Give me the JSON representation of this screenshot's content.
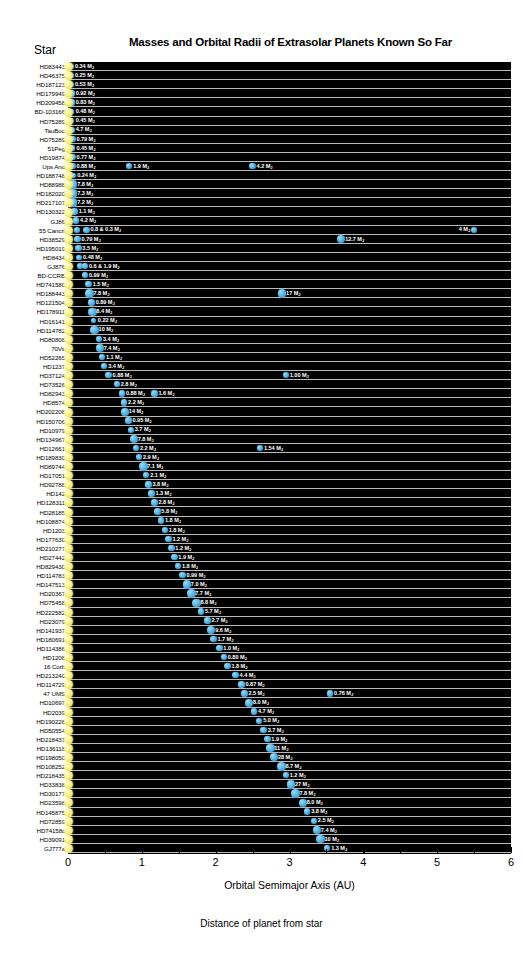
{
  "title": "Masses and Orbital Radii of Extrasolar Planets Known So Far",
  "star_column_header": "Star",
  "xlabel": "Orbital Semimajor Axis (AU)",
  "caption": "Distance of planet from star",
  "colors": {
    "plot_background": "#000000",
    "gridline": "#b9b9b9",
    "planet": "#5ab4e0",
    "star": "#f5f08a",
    "label_text": "#ffffff",
    "page_background": "#ffffff"
  },
  "axis": {
    "ticks": [
      "0",
      "1",
      "2",
      "3",
      "4",
      "5",
      "6"
    ],
    "min": 0,
    "max": 6,
    "minor_ticks_per_unit": 2
  },
  "mass_unit": "M",
  "mass_unit_sub": "J",
  "chart_data": {
    "type": "scatter",
    "title": "Masses and Orbital Radii of Extrasolar Planets Known So Far",
    "xlabel": "Orbital Semimajor Axis (AU)",
    "ylabel": "Star",
    "xlim": [
      0,
      6
    ],
    "grid": true,
    "legend": "none",
    "rows": [
      {
        "star": "HD83443",
        "planets": [
          {
            "a": 0.04,
            "label": "0.34 M"
          }
        ]
      },
      {
        "star": "HD46375",
        "planets": [
          {
            "a": 0.04,
            "label": "0.25 M"
          }
        ]
      },
      {
        "star": "HD187123",
        "planets": [
          {
            "a": 0.04,
            "label": "0.53 M"
          }
        ]
      },
      {
        "star": "HD179949",
        "planets": [
          {
            "a": 0.05,
            "label": "0.92 M"
          }
        ]
      },
      {
        "star": "HD209458",
        "planets": [
          {
            "a": 0.05,
            "label": "0.83 M"
          }
        ]
      },
      {
        "star": "BD-103166",
        "planets": [
          {
            "a": 0.05,
            "label": "0.48 M"
          }
        ]
      },
      {
        "star": "HD75289",
        "planets": [
          {
            "a": 0.05,
            "label": "0.45 M"
          }
        ]
      },
      {
        "star": "TauBoo",
        "planets": [
          {
            "a": 0.05,
            "label": "4.7 M"
          }
        ]
      },
      {
        "star": "HD75289",
        "planets": [
          {
            "a": 0.06,
            "label": "0.79 M"
          }
        ]
      },
      {
        "star": "51Peg",
        "planets": [
          {
            "a": 0.06,
            "label": "0.45 M"
          }
        ]
      },
      {
        "star": "HD19874",
        "planets": [
          {
            "a": 0.06,
            "label": "0.77 M"
          }
        ]
      },
      {
        "star": "Ups And",
        "planets": [
          {
            "a": 0.06,
            "label": "0.88 M"
          },
          {
            "a": 0.83,
            "label": "1.9 M"
          },
          {
            "a": 2.5,
            "label": "4.2 M"
          }
        ]
      },
      {
        "star": "HD188748",
        "planets": [
          {
            "a": 0.07,
            "label": "0.24 M"
          }
        ]
      },
      {
        "star": "HD88988",
        "planets": [
          {
            "a": 0.07,
            "label": "7.8 M"
          }
        ]
      },
      {
        "star": "HD182020",
        "planets": [
          {
            "a": 0.07,
            "label": "7.3 M"
          }
        ]
      },
      {
        "star": "HD217107",
        "planets": [
          {
            "a": 0.07,
            "label": "7.2 M"
          }
        ]
      },
      {
        "star": "HD130322",
        "planets": [
          {
            "a": 0.09,
            "label": "1.1 M"
          }
        ]
      },
      {
        "star": "GJ86",
        "planets": [
          {
            "a": 0.11,
            "label": "4.2 M"
          }
        ]
      },
      {
        "star": "55 Cancrf",
        "planets": [
          {
            "a": 0.12,
            "label": ""
          },
          {
            "a": 0.25,
            "label": "0.8 & 0.3 M"
          },
          {
            "a": 5.5,
            "label": "4 M",
            "flip": true
          }
        ]
      },
      {
        "star": "HD38529",
        "planets": [
          {
            "a": 0.13,
            "label": "0.79 M"
          },
          {
            "a": 3.7,
            "label": "12.7 M"
          }
        ]
      },
      {
        "star": "HD195019",
        "planets": [
          {
            "a": 0.14,
            "label": "3.5 M"
          }
        ]
      },
      {
        "star": "HD8434",
        "planets": [
          {
            "a": 0.15,
            "label": "0.48 M"
          }
        ]
      },
      {
        "star": "GJ876",
        "planets": [
          {
            "a": 0.16,
            "label": ""
          },
          {
            "a": 0.23,
            "label": "0.6 & 1.9 M"
          }
        ]
      },
      {
        "star": "BD-CCRB",
        "planets": [
          {
            "a": 0.23,
            "label": "0.99 M"
          }
        ]
      },
      {
        "star": "HD741580",
        "planets": [
          {
            "a": 0.28,
            "label": "1.5 M"
          }
        ]
      },
      {
        "star": "HD188443",
        "planets": [
          {
            "a": 0.29,
            "label": "7.8 M"
          },
          {
            "a": 2.9,
            "label": "17 M"
          }
        ]
      },
      {
        "star": "HD121504",
        "planets": [
          {
            "a": 0.32,
            "label": "0.89 M"
          }
        ]
      },
      {
        "star": "HD178911",
        "planets": [
          {
            "a": 0.33,
            "label": "8.4 M"
          }
        ]
      },
      {
        "star": "HD16141",
        "planets": [
          {
            "a": 0.35,
            "label": "0.22 M"
          }
        ]
      },
      {
        "star": "HD114782",
        "planets": [
          {
            "a": 0.36,
            "label": "10 M"
          }
        ]
      },
      {
        "star": "HD80808",
        "planets": [
          {
            "a": 0.42,
            "label": "3.4 M"
          }
        ]
      },
      {
        "star": "70Vir",
        "planets": [
          {
            "a": 0.43,
            "label": "7.4 M"
          }
        ]
      },
      {
        "star": "HD52265",
        "planets": [
          {
            "a": 0.46,
            "label": "1.1 M"
          }
        ]
      },
      {
        "star": "HD1237",
        "planets": [
          {
            "a": 0.49,
            "label": "3.4 M"
          }
        ]
      },
      {
        "star": "HD37124",
        "planets": [
          {
            "a": 0.55,
            "label": "0.88 M"
          },
          {
            "a": 2.95,
            "label": "1.00 M"
          }
        ]
      },
      {
        "star": "HD73526",
        "planets": [
          {
            "a": 0.66,
            "label": "2.8 M"
          }
        ]
      },
      {
        "star": "HD82943",
        "planets": [
          {
            "a": 0.73,
            "label": "0.88 M"
          },
          {
            "a": 1.17,
            "label": "1.6 M"
          }
        ]
      },
      {
        "star": "HD8574",
        "planets": [
          {
            "a": 0.76,
            "label": "2.2 M"
          }
        ]
      },
      {
        "star": "HD202206",
        "planets": [
          {
            "a": 0.77,
            "label": "14 M"
          }
        ]
      },
      {
        "star": "HD150706",
        "planets": [
          {
            "a": 0.82,
            "label": "0.95 M"
          }
        ]
      },
      {
        "star": "HD10979",
        "planets": [
          {
            "a": 0.85,
            "label": "3.7 M"
          }
        ]
      },
      {
        "star": "HD134967",
        "planets": [
          {
            "a": 0.89,
            "label": "7.8 M"
          }
        ]
      },
      {
        "star": "HD12661",
        "planets": [
          {
            "a": 0.92,
            "label": "2.2 M"
          },
          {
            "a": 2.6,
            "label": "1.54 M"
          }
        ]
      },
      {
        "star": "HD189830",
        "planets": [
          {
            "a": 0.96,
            "label": "2.9 M"
          }
        ]
      },
      {
        "star": "HD89744",
        "planets": [
          {
            "a": 1.02,
            "label": "7.1 M"
          }
        ]
      },
      {
        "star": "HD17051",
        "planets": [
          {
            "a": 1.06,
            "label": "2.1 M"
          }
        ]
      },
      {
        "star": "HD92788",
        "planets": [
          {
            "a": 1.09,
            "label": "3.8 M"
          }
        ]
      },
      {
        "star": "HD142",
        "planets": [
          {
            "a": 1.13,
            "label": "1.3 M"
          }
        ]
      },
      {
        "star": "HD128311",
        "planets": [
          {
            "a": 1.17,
            "label": "2.8 M"
          }
        ]
      },
      {
        "star": "HD28185",
        "planets": [
          {
            "a": 1.21,
            "label": "5.8 M"
          }
        ]
      },
      {
        "star": "HD108874",
        "planets": [
          {
            "a": 1.26,
            "label": "1.8 M"
          }
        ]
      },
      {
        "star": "HD1203",
        "planets": [
          {
            "a": 1.31,
            "label": "1.8 M"
          }
        ]
      },
      {
        "star": "HD177630",
        "planets": [
          {
            "a": 1.36,
            "label": "1.2 M"
          }
        ]
      },
      {
        "star": "HD210277",
        "planets": [
          {
            "a": 1.4,
            "label": "1.2 M"
          }
        ]
      },
      {
        "star": "HD27442",
        "planets": [
          {
            "a": 1.44,
            "label": "1.9 M"
          }
        ]
      },
      {
        "star": "HD829430",
        "planets": [
          {
            "a": 1.49,
            "label": "1.8 M"
          }
        ]
      },
      {
        "star": "HD114783",
        "planets": [
          {
            "a": 1.55,
            "label": "0.99 M"
          }
        ]
      },
      {
        "star": "HD147513",
        "planets": [
          {
            "a": 1.61,
            "label": "7.0 M"
          }
        ]
      },
      {
        "star": "HD20367",
        "planets": [
          {
            "a": 1.67,
            "label": "7.7 M"
          }
        ]
      },
      {
        "star": "HD75458",
        "planets": [
          {
            "a": 1.74,
            "label": "8.8 M"
          }
        ]
      },
      {
        "star": "HD222582",
        "planets": [
          {
            "a": 1.8,
            "label": "5.7 M"
          }
        ]
      },
      {
        "star": "HD23079",
        "planets": [
          {
            "a": 1.89,
            "label": "2.7 M"
          }
        ]
      },
      {
        "star": "HD141937",
        "planets": [
          {
            "a": 1.94,
            "label": "9.6 M"
          }
        ]
      },
      {
        "star": "HD180691",
        "planets": [
          {
            "a": 1.97,
            "label": "1.7 M"
          }
        ]
      },
      {
        "star": "HD114386",
        "planets": [
          {
            "a": 2.05,
            "label": "1.0 M"
          }
        ]
      },
      {
        "star": "HD1208",
        "planets": [
          {
            "a": 2.11,
            "label": "0.80 M"
          }
        ]
      },
      {
        "star": "16 Corb",
        "planets": [
          {
            "a": 2.16,
            "label": "1.8 M"
          }
        ]
      },
      {
        "star": "HD213240",
        "planets": [
          {
            "a": 2.27,
            "label": "4.4 M"
          }
        ]
      },
      {
        "star": "HD114729",
        "planets": [
          {
            "a": 2.35,
            "label": "0.87 M"
          }
        ]
      },
      {
        "star": "47 UMS",
        "planets": [
          {
            "a": 2.39,
            "label": "2.5 M"
          },
          {
            "a": 3.55,
            "label": "0.76 M"
          }
        ]
      },
      {
        "star": "HD10697",
        "planets": [
          {
            "a": 2.45,
            "label": "8.0 M"
          }
        ]
      },
      {
        "star": "HD2039",
        "planets": [
          {
            "a": 2.52,
            "label": "4.7 M"
          }
        ]
      },
      {
        "star": "HD190226",
        "planets": [
          {
            "a": 2.59,
            "label": "5.0 M"
          }
        ]
      },
      {
        "star": "HD50554",
        "planets": [
          {
            "a": 2.65,
            "label": "3.7 M"
          }
        ]
      },
      {
        "star": "HD218437",
        "planets": [
          {
            "a": 2.7,
            "label": "1.9 M"
          }
        ]
      },
      {
        "star": "HD136118",
        "planets": [
          {
            "a": 2.74,
            "label": "11 M"
          }
        ]
      },
      {
        "star": "HD198050",
        "planets": [
          {
            "a": 2.79,
            "label": "28 M"
          }
        ]
      },
      {
        "star": "HD108252",
        "planets": [
          {
            "a": 2.89,
            "label": "8.7 M"
          }
        ]
      },
      {
        "star": "HD218435",
        "planets": [
          {
            "a": 2.95,
            "label": "1.2 M"
          }
        ]
      },
      {
        "star": "HD33838",
        "planets": [
          {
            "a": 3.02,
            "label": "27 M"
          }
        ]
      },
      {
        "star": "HD30177",
        "planets": [
          {
            "a": 3.08,
            "label": "7.8 M"
          }
        ]
      },
      {
        "star": "HD23598",
        "planets": [
          {
            "a": 3.18,
            "label": "8.0 M"
          }
        ]
      },
      {
        "star": "HD145875",
        "planets": [
          {
            "a": 3.24,
            "label": "3.8 M"
          }
        ]
      },
      {
        "star": "HD72859",
        "planets": [
          {
            "a": 3.33,
            "label": "2.5 M"
          }
        ]
      },
      {
        "star": "HD74158c",
        "planets": [
          {
            "a": 3.37,
            "label": "7.4 M"
          }
        ]
      },
      {
        "star": "HD39091",
        "planets": [
          {
            "a": 3.42,
            "label": "10 M"
          }
        ]
      },
      {
        "star": "GJ777a",
        "planets": [
          {
            "a": 3.51,
            "label": "1.3 M"
          }
        ]
      }
    ]
  }
}
